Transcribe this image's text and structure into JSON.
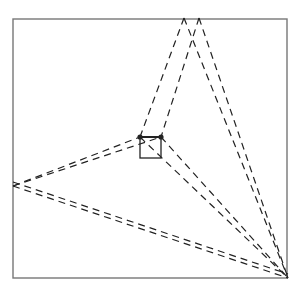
{
  "diagram": {
    "stroke_color": "#222222",
    "frame_color": "#777777",
    "frame": {
      "x1": 13,
      "y1": 19,
      "x2": 287,
      "y2": 278
    },
    "vertices": {
      "top_a": [
        184,
        18
      ],
      "top_b": [
        199,
        18
      ],
      "left": [
        13,
        186
      ],
      "bottom_right": [
        288,
        278
      ]
    },
    "center_square": {
      "x": 140,
      "y": 137,
      "size": 21
    },
    "dots": [
      [
        140,
        137
      ],
      [
        161,
        137
      ]
    ],
    "dashed_lines": [
      {
        "from": [
          184,
          18
        ],
        "to": [
          140,
          137
        ]
      },
      {
        "from": [
          199,
          18
        ],
        "to": [
          161,
          137
        ]
      },
      {
        "from": [
          199,
          18
        ],
        "to": [
          288,
          278
        ]
      },
      {
        "from": [
          184,
          18
        ],
        "to": [
          288,
          278
        ]
      },
      {
        "from": [
          13,
          186
        ],
        "to": [
          140,
          137
        ]
      },
      {
        "from": [
          13,
          186
        ],
        "to": [
          161,
          137
        ]
      },
      {
        "from": [
          13,
          186
        ],
        "to": [
          288,
          278
        ]
      },
      {
        "from": [
          13,
          182
        ],
        "to": [
          288,
          274
        ]
      },
      {
        "from": [
          140,
          137
        ],
        "to": [
          288,
          278
        ]
      },
      {
        "from": [
          161,
          137
        ],
        "to": [
          288,
          278
        ]
      }
    ]
  }
}
